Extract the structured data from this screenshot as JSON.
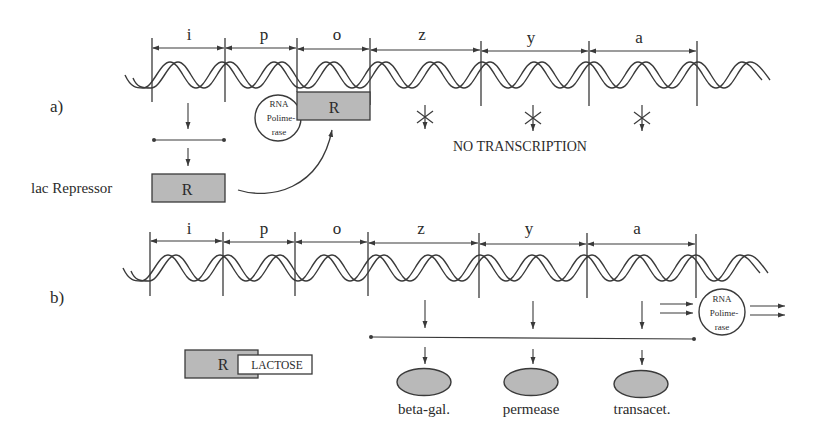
{
  "colors": {
    "line": "#3a3a3a",
    "fill_gray": "#b9b9b9",
    "background": "#ffffff"
  },
  "gene_segments": [
    "i",
    "p",
    "o",
    "z",
    "y",
    "a"
  ],
  "panel_a": {
    "label": "a)",
    "segments": [
      "i",
      "p",
      "o",
      "z",
      "y",
      "a"
    ],
    "rna_polymerase": {
      "line1": "RNA",
      "line2": "Polime-",
      "line3": "rase"
    },
    "operator_repressor_label": "R",
    "lac_repressor_label": "lac Repressor",
    "repressor_box_label": "R",
    "no_transcription_label": "NO TRANSCRIPTION",
    "blocked_marker": "asterisk"
  },
  "panel_b": {
    "label": "b)",
    "segments": [
      "i",
      "p",
      "o",
      "z",
      "y",
      "a"
    ],
    "rna_polymerase": {
      "line1": "RNA",
      "line2": "Polime-",
      "line3": "rase"
    },
    "repressor_label": "R",
    "inducer_label": "LACTOSE",
    "products": [
      {
        "name": "beta-gal."
      },
      {
        "name": "permease"
      },
      {
        "name": "transacet."
      }
    ]
  }
}
